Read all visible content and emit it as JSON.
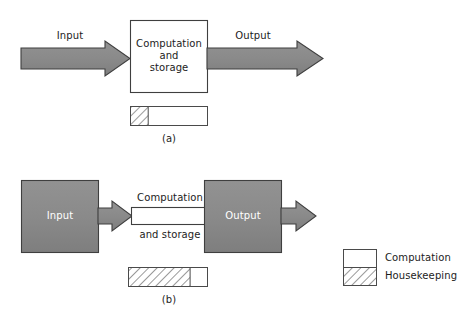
{
  "figure": {
    "background_color": "#ffffff",
    "fill_gray": "#8a8a8a",
    "stroke_dark": "#3a3a3a",
    "stroke_light": "#555555",
    "hatch_color": "#6e6e6e",
    "text_color": "#1c1c1c",
    "text_on_fill_color": "#ffffff"
  },
  "panel_a": {
    "tag": "(a)",
    "input_arrow_label": "Input",
    "output_arrow_label": "Output",
    "process_box_lines": [
      "Computation",
      "and",
      "storage"
    ],
    "time_bar": {
      "housekeeping_fraction": 0.23,
      "computation_fraction": 0.77
    }
  },
  "panel_b": {
    "tag": "(b)",
    "input_box_label": "Input",
    "output_box_label": "Output",
    "process_label_top": "Computation",
    "process_label_bottom": "and storage",
    "time_bar": {
      "housekeeping_fraction": 0.78,
      "computation_fraction": 0.22
    }
  },
  "legend": {
    "items": [
      {
        "label": "Computation",
        "swatch": "white"
      },
      {
        "label": "Housekeeping",
        "swatch": "hatched"
      }
    ]
  }
}
